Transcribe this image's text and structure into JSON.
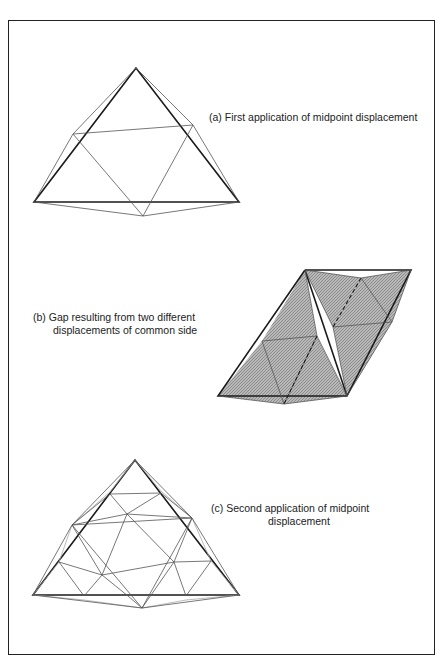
{
  "figure": {
    "panels": [
      {
        "id": "a",
        "caption_line1": "(a)  First application of midpoint displacement",
        "caption_line2": ""
      },
      {
        "id": "b",
        "caption_line1": "(b)  Gap resulting from two different",
        "caption_line2": "displacements of common side"
      },
      {
        "id": "c",
        "caption_line1": "(c)  Second application of midpoint",
        "caption_line2": "displacement"
      }
    ],
    "colors": {
      "line": "#1a1a1a",
      "thin_line": "#555555",
      "shading": "#9a9a9a",
      "background": "#ffffff"
    }
  }
}
